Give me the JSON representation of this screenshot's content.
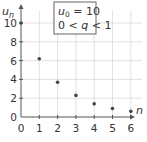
{
  "chart_data": {
    "type": "scatter",
    "title": "",
    "xlabel": "n",
    "ylabel": "u_n",
    "x": [
      0,
      1,
      2,
      3,
      4,
      5,
      6
    ],
    "series": [
      {
        "name": "u_n",
        "values": [
          10,
          6.2,
          3.7,
          2.3,
          1.4,
          0.9,
          0.6
        ]
      }
    ],
    "xlim": [
      0,
      6.5
    ],
    "ylim": [
      0,
      11
    ],
    "x_ticks": [
      "0",
      "1",
      "2",
      "3",
      "4",
      "5",
      "6"
    ],
    "y_ticks": [
      "0",
      "2",
      "4",
      "6",
      "8",
      "10"
    ],
    "grid": true,
    "legend": "none",
    "annotation": {
      "line1": "u0 = 10",
      "line2": "0 < q < 1"
    },
    "colors": {
      "point": "#444444",
      "axis": "#555555",
      "grid": "#d9d9d9",
      "box_border": "#666666"
    }
  },
  "labels": {
    "y_axis_main": "u",
    "y_axis_sub": "n",
    "x_axis": "n",
    "box_line1_var": "u",
    "box_line1_sub": "0",
    "box_line1_rest": " = 10",
    "box_line2_a": "0 < ",
    "box_line2_q": "q",
    "box_line2_b": " < 1"
  }
}
